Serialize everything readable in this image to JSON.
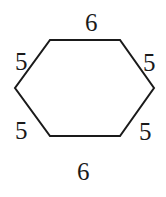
{
  "diagram": {
    "shape": "hexagon",
    "stroke_color": "#1a1a1a",
    "vertices": [
      [
        50,
        40
      ],
      [
        120,
        40
      ],
      [
        154,
        88
      ],
      [
        120,
        136
      ],
      [
        50,
        136
      ],
      [
        15,
        88
      ]
    ],
    "side_labels": {
      "top": "6",
      "upper_right": "5",
      "lower_right": "5",
      "bottom": "6",
      "lower_left": "5",
      "upper_left": "5"
    }
  }
}
